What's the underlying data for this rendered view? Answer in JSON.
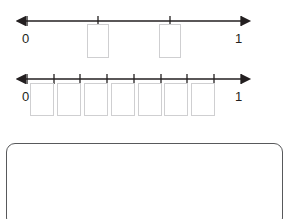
{
  "worksheet": {
    "name": "fraction-number-lines-worksheet",
    "background_color": "#ffffff",
    "text_color": "#231f20",
    "box_border_color": "#cfcfd1",
    "work_area_border_color": "#58595b"
  },
  "number_lines": [
    {
      "id": "number-line-1",
      "left_label": "0",
      "right_label": "1",
      "denominator": 3,
      "tick_count": 4,
      "tick_fractions": [
        0,
        0.3333,
        0.6667,
        1
      ],
      "tick_labels": [
        "0",
        "",
        "",
        "1"
      ],
      "answer_box_count": 2,
      "answer_boxes": [
        {
          "id": "answer-box-1-1",
          "value": "",
          "at_fraction": 0.3333
        },
        {
          "id": "answer-box-1-2",
          "value": "",
          "at_fraction": 0.6667
        }
      ]
    },
    {
      "id": "number-line-2",
      "left_label": "0",
      "right_label": "1",
      "denominator": 8,
      "tick_count": 9,
      "tick_fractions": [
        0,
        0.125,
        0.25,
        0.375,
        0.5,
        0.625,
        0.75,
        0.875,
        1
      ],
      "tick_labels": [
        "0",
        "",
        "",
        "",
        "",
        "",
        "",
        "",
        "1"
      ],
      "answer_box_count": 7,
      "answer_boxes": [
        {
          "id": "answer-box-2-1",
          "value": "",
          "at_fraction": 0.0625
        },
        {
          "id": "answer-box-2-2",
          "value": "",
          "at_fraction": 0.1875
        },
        {
          "id": "answer-box-2-3",
          "value": "",
          "at_fraction": 0.3125
        },
        {
          "id": "answer-box-2-4",
          "value": "",
          "at_fraction": 0.4375
        },
        {
          "id": "answer-box-2-5",
          "value": "",
          "at_fraction": 0.5625
        },
        {
          "id": "answer-box-2-6",
          "value": "",
          "at_fraction": 0.6875
        },
        {
          "id": "answer-box-2-7",
          "value": "",
          "at_fraction": 0.8125
        }
      ]
    }
  ],
  "work_area": {
    "id": "work-area",
    "value": "",
    "placeholder": ""
  },
  "geometry": {
    "axis_start_x": 27,
    "axis_end_x": 241,
    "axis_y": 13,
    "arrow_left_x": 18,
    "arrow_right_x": 250
  }
}
